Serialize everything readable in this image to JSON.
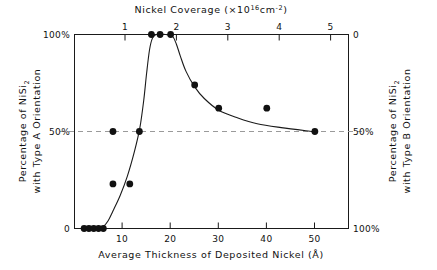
{
  "chart_data": {
    "type": "scatter",
    "title": "",
    "xlabel": "Average Thickness of Deposited Nickel (Å)",
    "xlabel_top": "Nickel Coverage (×10¹⁶cm⁻²)",
    "ylabel": "Percentage of NiSi₂ with Type A Orientation",
    "ylabel_right": "Percentage of NiSi₂ with Type B Orientation",
    "xlim": [
      0,
      57
    ],
    "ylim": [
      0,
      100
    ],
    "xticks": [
      10,
      20,
      30,
      40,
      50
    ],
    "xticklabels": [
      "10",
      "20",
      "30",
      "40",
      "50"
    ],
    "xticks_top": [
      1,
      2,
      3,
      4,
      5
    ],
    "xticklabels_top": [
      "1",
      "2",
      "3",
      "4",
      "5"
    ],
    "yticks": [
      0,
      50,
      100
    ],
    "yticklabels": [
      "0",
      "50%",
      "100%"
    ],
    "yticklabels_right": [
      "100%",
      "50%",
      "0"
    ],
    "grid": false,
    "reference_line": {
      "y": 50,
      "style": "dashed",
      "color": "#9a9a9a"
    },
    "legend": "none",
    "marker": {
      "shape": "circle",
      "color": "#111111",
      "size": 3.4
    },
    "curve": {
      "color": "#1a1a1a",
      "width": 1.1
    },
    "points": [
      {
        "x": 2.0,
        "y": 0
      },
      {
        "x": 3.0,
        "y": 0
      },
      {
        "x": 4.0,
        "y": 0
      },
      {
        "x": 5.0,
        "y": 0
      },
      {
        "x": 6.0,
        "y": 0
      },
      {
        "x": 8.0,
        "y": 23
      },
      {
        "x": 11.5,
        "y": 23
      },
      {
        "x": 8.0,
        "y": 50
      },
      {
        "x": 13.5,
        "y": 50
      },
      {
        "x": 16.0,
        "y": 100
      },
      {
        "x": 17.8,
        "y": 100
      },
      {
        "x": 20.0,
        "y": 100
      },
      {
        "x": 25.0,
        "y": 74
      },
      {
        "x": 30.0,
        "y": 62
      },
      {
        "x": 40.0,
        "y": 62
      },
      {
        "x": 50.0,
        "y": 50
      }
    ],
    "curve_points": [
      {
        "x": 5.2,
        "y": 0
      },
      {
        "x": 6.0,
        "y": 1
      },
      {
        "x": 7.0,
        "y": 4
      },
      {
        "x": 8.0,
        "y": 9
      },
      {
        "x": 9.5,
        "y": 17
      },
      {
        "x": 11.0,
        "y": 27
      },
      {
        "x": 12.5,
        "y": 40
      },
      {
        "x": 13.6,
        "y": 52
      },
      {
        "x": 14.4,
        "y": 66
      },
      {
        "x": 15.0,
        "y": 80
      },
      {
        "x": 15.6,
        "y": 92
      },
      {
        "x": 16.2,
        "y": 98
      },
      {
        "x": 17.0,
        "y": 100
      },
      {
        "x": 19.0,
        "y": 100
      },
      {
        "x": 20.4,
        "y": 99
      },
      {
        "x": 21.2,
        "y": 95
      },
      {
        "x": 22.0,
        "y": 89
      },
      {
        "x": 23.2,
        "y": 81
      },
      {
        "x": 25.0,
        "y": 73
      },
      {
        "x": 27.0,
        "y": 67
      },
      {
        "x": 30.0,
        "y": 61
      },
      {
        "x": 34.0,
        "y": 57
      },
      {
        "x": 38.0,
        "y": 54
      },
      {
        "x": 43.0,
        "y": 52
      },
      {
        "x": 49.5,
        "y": 50
      }
    ]
  },
  "axes": {
    "bottom_title": "Average Thickness of Deposited Nickel (Å)",
    "top_title_main": "Nickel Coverage (×10",
    "top_title_sup": "16",
    "top_title_mid": "cm",
    "top_title_sup2": "-2",
    "top_title_end": ")",
    "left_title_line1_a": "Percentage of NiSi",
    "left_title_line1_sub": "2",
    "left_title_line2": "with Type A Orientation",
    "right_title_line1_a": "Percentage of NiSi",
    "right_title_line1_sub": "2",
    "right_title_line2": "with Type B Orientation",
    "left_tick_top": "100%",
    "left_tick_mid": "50%",
    "left_tick_bottom": "0",
    "right_tick_top": "0",
    "right_tick_mid": "50%",
    "right_tick_bottom": "100%",
    "bottom_tick_1": "10",
    "bottom_tick_2": "20",
    "bottom_tick_3": "30",
    "bottom_tick_4": "40",
    "bottom_tick_5": "50",
    "top_tick_1": "1",
    "top_tick_2": "2",
    "top_tick_3": "3",
    "top_tick_4": "4",
    "top_tick_5": "5"
  },
  "colors": {
    "frame": "#1a1a1a",
    "marker": "#111111",
    "curve": "#1a1a1a",
    "dashed": "#9a9a9a",
    "background": "#ffffff"
  }
}
